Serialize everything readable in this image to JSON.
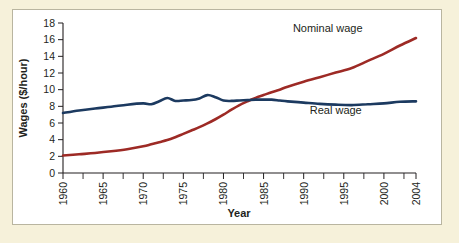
{
  "figure": {
    "background_color": "#f6f1da",
    "card_background": "#ffffff",
    "card_border_color": "#b9b5a0"
  },
  "chart_data": {
    "type": "line",
    "title": "",
    "xlabel": "Year",
    "ylabel": "Wages ($/hour)",
    "xlim": [
      1960,
      2004
    ],
    "ylim": [
      0,
      18
    ],
    "grid": false,
    "legend_position": "inline-annotation",
    "y_ticks": [
      0,
      2,
      4,
      6,
      8,
      10,
      12,
      14,
      16,
      18
    ],
    "x_ticks": [
      1960,
      1965,
      1970,
      1975,
      1980,
      1985,
      1990,
      1995,
      2000,
      2004
    ],
    "x_minor_tick_interval": 2.5,
    "x": [
      1960,
      1962,
      1964,
      1966,
      1968,
      1970,
      1971,
      1972,
      1973,
      1974,
      1975,
      1976,
      1977,
      1978,
      1979,
      1980,
      1981,
      1982,
      1983,
      1984,
      1985,
      1986,
      1987,
      1988,
      1990,
      1992,
      1994,
      1996,
      1998,
      2000,
      2002,
      2004
    ],
    "series": [
      {
        "name": "Nominal wage",
        "color": "#9d2a25",
        "label_text": "Nominal wage",
        "values": [
          2.1,
          2.25,
          2.4,
          2.6,
          2.85,
          3.2,
          3.45,
          3.7,
          3.95,
          4.3,
          4.7,
          5.1,
          5.5,
          5.95,
          6.45,
          7.0,
          7.6,
          8.15,
          8.6,
          9.0,
          9.35,
          9.7,
          10.0,
          10.35,
          10.95,
          11.5,
          12.05,
          12.6,
          13.45,
          14.3,
          15.3,
          16.2
        ]
      },
      {
        "name": "Real wage",
        "color": "#1c3a60",
        "label_text": "Real wage",
        "values": [
          7.2,
          7.5,
          7.75,
          7.95,
          8.2,
          8.35,
          8.25,
          8.6,
          9.0,
          8.65,
          8.7,
          8.75,
          8.95,
          9.35,
          9.1,
          8.7,
          8.65,
          8.7,
          8.75,
          8.8,
          8.8,
          8.8,
          8.7,
          8.6,
          8.45,
          8.3,
          8.2,
          8.15,
          8.25,
          8.35,
          8.55,
          8.6
        ]
      }
    ],
    "annotations": [
      {
        "text": "Nominal wage",
        "series": "Nominal wage",
        "x": 1993,
        "y": 16.9
      },
      {
        "text": "Real wage",
        "series": "Real wage",
        "x": 1994,
        "y": 7.1
      }
    ]
  }
}
